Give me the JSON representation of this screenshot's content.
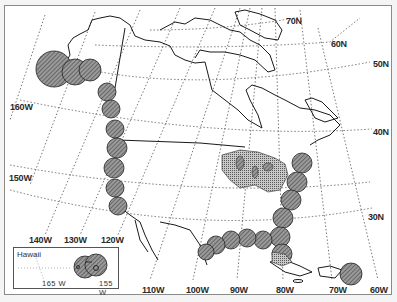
{
  "map": {
    "region": "North America",
    "projection": "polar conic graticule",
    "colors": {
      "background": "#ffffff",
      "coastline": "#1a1a1a",
      "graticule": "#555555",
      "circle_fill": "#9a9a9a",
      "circle_hatch": "#3a3a3a",
      "great_lakes_stipple": "#6a6a6a"
    },
    "latitude_labels": [
      {
        "text": "70N",
        "x": 286,
        "y": 17
      },
      {
        "text": "60N",
        "x": 331,
        "y": 40
      },
      {
        "text": "50N",
        "x": 373,
        "y": 60
      },
      {
        "text": "40N",
        "x": 373,
        "y": 128
      },
      {
        "text": "30N",
        "x": 368,
        "y": 213
      }
    ],
    "longitude_labels": [
      {
        "text": "160W",
        "x": 10,
        "y": 103
      },
      {
        "text": "150W",
        "x": 9,
        "y": 174
      },
      {
        "text": "140W",
        "x": 29,
        "y": 236
      },
      {
        "text": "130W",
        "x": 64,
        "y": 236
      },
      {
        "text": "120W",
        "x": 101,
        "y": 236
      },
      {
        "text": "110W",
        "x": 142,
        "y": 286
      },
      {
        "text": "100W",
        "x": 186,
        "y": 286
      },
      {
        "text": "90W",
        "x": 230,
        "y": 286
      },
      {
        "text": "80W",
        "x": 276,
        "y": 286
      },
      {
        "text": "70W",
        "x": 329,
        "y": 286
      },
      {
        "text": "60W",
        "x": 370,
        "y": 286
      }
    ],
    "inset": {
      "title": "Hawaii",
      "labels": [
        {
          "text": "165 W",
          "x": 28,
          "y": 32
        },
        {
          "text": "155 W",
          "x": 86,
          "y": 32
        }
      ]
    },
    "coverage_circles": [
      {
        "group": "alaska",
        "cx": 54,
        "cy": 69,
        "r": 18
      },
      {
        "group": "alaska",
        "cx": 75,
        "cy": 72,
        "r": 13
      },
      {
        "group": "alaska",
        "cx": 90,
        "cy": 70,
        "r": 11
      },
      {
        "group": "pacific",
        "cx": 107,
        "cy": 92,
        "r": 9
      },
      {
        "group": "pacific",
        "cx": 111,
        "cy": 109,
        "r": 9
      },
      {
        "group": "pacific",
        "cx": 115,
        "cy": 129,
        "r": 9
      },
      {
        "group": "pacific",
        "cx": 117,
        "cy": 148,
        "r": 10
      },
      {
        "group": "pacific",
        "cx": 114,
        "cy": 168,
        "r": 10
      },
      {
        "group": "pacific",
        "cx": 115,
        "cy": 188,
        "r": 9
      },
      {
        "group": "pacific",
        "cx": 118,
        "cy": 206,
        "r": 9
      },
      {
        "group": "atlantic",
        "cx": 302,
        "cy": 163,
        "r": 10
      },
      {
        "group": "atlantic",
        "cx": 297,
        "cy": 182,
        "r": 10
      },
      {
        "group": "atlantic",
        "cx": 291,
        "cy": 200,
        "r": 10
      },
      {
        "group": "atlantic",
        "cx": 283,
        "cy": 218,
        "r": 10
      },
      {
        "group": "atlantic",
        "cx": 280,
        "cy": 237,
        "r": 10
      },
      {
        "group": "atlantic",
        "cx": 282,
        "cy": 254,
        "r": 10
      },
      {
        "group": "gulf",
        "cx": 263,
        "cy": 240,
        "r": 9
      },
      {
        "group": "gulf",
        "cx": 247,
        "cy": 238,
        "r": 9
      },
      {
        "group": "gulf",
        "cx": 231,
        "cy": 240,
        "r": 9
      },
      {
        "group": "gulf",
        "cx": 216,
        "cy": 245,
        "r": 9
      },
      {
        "group": "gulf",
        "cx": 206,
        "cy": 252,
        "r": 8
      },
      {
        "group": "puerto_rico",
        "cx": 351,
        "cy": 274,
        "r": 11
      }
    ]
  }
}
